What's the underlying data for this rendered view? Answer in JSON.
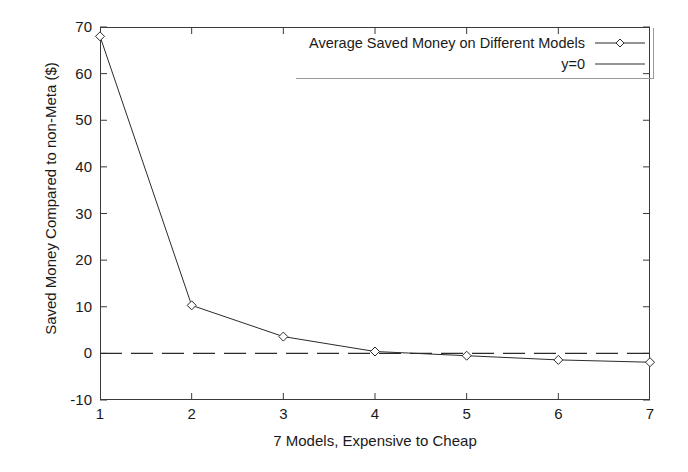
{
  "chart_data": {
    "type": "line",
    "title": "",
    "xlabel": "7 Models, Expensive to Cheap",
    "ylabel": "Saved Money Compared to non-Meta ($)",
    "x": [
      1,
      2,
      3,
      4,
      5,
      6,
      7
    ],
    "xticks": [
      "1",
      "2",
      "3",
      "4",
      "5",
      "6",
      "7"
    ],
    "yticks": [
      "-10",
      "0",
      "10",
      "20",
      "30",
      "40",
      "50",
      "60",
      "70"
    ],
    "ytick_values": [
      -10,
      0,
      10,
      20,
      30,
      40,
      50,
      60,
      70
    ],
    "xlim": [
      1,
      7
    ],
    "ylim": [
      -10,
      70
    ],
    "grid": false,
    "legend_position": "top-right",
    "series": [
      {
        "name": "Average Saved Money on Different Models",
        "marker": "diamond",
        "linestyle": "solid",
        "color": "#2b2b2b",
        "values": [
          68.0,
          10.3,
          3.6,
          0.4,
          -0.5,
          -1.4,
          -1.9
        ]
      },
      {
        "name": "y=0",
        "marker": "none",
        "linestyle": "dashed",
        "color": "#2b2b2b",
        "values": [
          0,
          0,
          0,
          0,
          0,
          0,
          0
        ]
      }
    ]
  },
  "legend": {
    "entries": [
      {
        "label": "Average Saved Money on Different Models",
        "key": "line-with-diamond-marker"
      },
      {
        "label": "y=0",
        "key": "plain-line"
      }
    ]
  },
  "colors": {
    "axis": "#3a3a3a",
    "data_line": "#2b2b2b",
    "zero_line": "#2b2b2b",
    "text": "#1a1a1a",
    "background": "#ffffff"
  }
}
